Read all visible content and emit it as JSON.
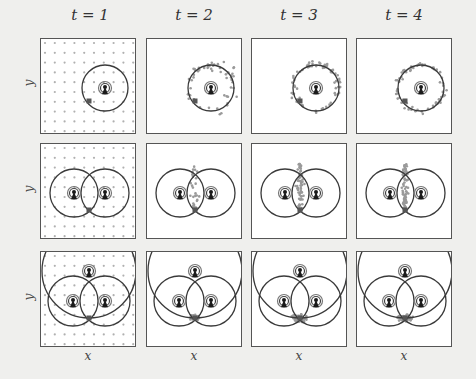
{
  "figure": {
    "column_titles": [
      "t = 1",
      "t = 2",
      "t = 3",
      "t = 4"
    ],
    "row_axis_label": "y",
    "col_axis_label": "x",
    "rows": [
      {
        "name": "one-anchor",
        "anchors": 1
      },
      {
        "name": "two-anchors",
        "anchors": 2
      },
      {
        "name": "three-anchors",
        "anchors": 3
      }
    ],
    "colors": {
      "background": "#efefed",
      "panel": "#ffffff",
      "border": "#555555",
      "circle": "#3a3a3a",
      "particle": "#9a9a9a",
      "grid_dot": "#b0b0b0",
      "true_position": "#555555",
      "anchor_icon": "#1a1a1a"
    },
    "icons": {
      "anchor": "antenna-tower-icon",
      "true_position": "square-marker"
    }
  }
}
